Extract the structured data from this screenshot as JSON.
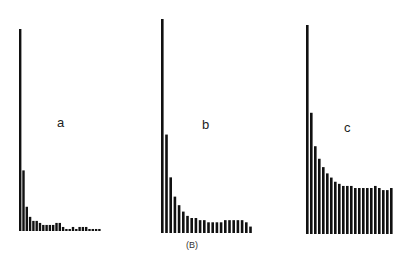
{
  "figure_label": "(B)",
  "chart_data": [
    {
      "type": "bar",
      "title": "a",
      "xlabel": "",
      "ylabel": "",
      "grid": false,
      "categories": [
        1,
        2,
        3,
        4,
        5,
        6,
        7,
        8,
        9,
        10,
        11,
        12,
        13,
        14,
        15,
        16,
        17,
        18,
        19,
        20,
        21,
        22,
        23,
        24,
        25
      ],
      "values": [
        100,
        30,
        12,
        7,
        5,
        5,
        4,
        3,
        3,
        3,
        3,
        4,
        4,
        2,
        1,
        1,
        2,
        1,
        2,
        2,
        2,
        1,
        1,
        1,
        1
      ],
      "ylim": [
        0,
        100
      ],
      "description": "Sharp decay: one dominant bar followed by near-zero values"
    },
    {
      "type": "bar",
      "title": "b",
      "xlabel": "",
      "ylabel": "",
      "grid": false,
      "categories": [
        1,
        2,
        3,
        4,
        5,
        6,
        7,
        8,
        9,
        10,
        11,
        12,
        13,
        14,
        15,
        16,
        17,
        18,
        19,
        20,
        21,
        22
      ],
      "values": [
        100,
        46,
        26,
        17,
        13,
        10,
        8,
        7,
        7,
        6,
        6,
        5,
        5,
        5,
        5,
        6,
        6,
        6,
        6,
        6,
        5,
        3
      ],
      "ylim": [
        0,
        100
      ],
      "description": "Moderate decay settling to a low plateau"
    },
    {
      "type": "bar",
      "title": "c",
      "xlabel": "",
      "ylabel": "",
      "grid": false,
      "categories": [
        1,
        2,
        3,
        4,
        5,
        6,
        7,
        8,
        9,
        10,
        11,
        12,
        13,
        14,
        15,
        16,
        17,
        18,
        19,
        20,
        21,
        22
      ],
      "values": [
        100,
        58,
        42,
        36,
        32,
        29,
        27,
        25,
        24,
        23,
        23,
        23,
        22,
        22,
        22,
        22,
        22,
        23,
        22,
        21,
        21,
        22
      ],
      "ylim": [
        0,
        100
      ],
      "description": "Gradual decay settling to a high plateau"
    }
  ],
  "panels": [
    {
      "label": "a",
      "left": 19,
      "baseline": 231,
      "top": 29,
      "bar_width": 2.4,
      "spacing": 3.3
    },
    {
      "label": "b",
      "left": 161,
      "baseline": 233,
      "top": 19,
      "bar_width": 2.6,
      "spacing": 4.2
    },
    {
      "label": "c",
      "left": 306,
      "baseline": 234,
      "top": 25,
      "bar_width": 2.6,
      "spacing": 4.0
    }
  ]
}
